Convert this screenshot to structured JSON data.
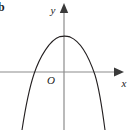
{
  "figure": {
    "background_color": "#ffffff",
    "corner_label": "b",
    "axis_color": "#8c8c8c",
    "curve_color": "#231f20",
    "label_color": "#1a1a1a"
  },
  "axes": {
    "x_axis": {
      "label": "x",
      "y_position": 72,
      "x_start": 0,
      "x_end": 118,
      "arrow_tip_x": 124,
      "label_x": 123,
      "label_y": 86
    },
    "y_axis": {
      "label": "y",
      "x_position": 64,
      "y_start": 130,
      "y_end": 10,
      "arrow_tip_y": 3,
      "label_x": 53,
      "label_y": 14
    },
    "origin": {
      "label": "O",
      "label_x": 51,
      "label_y": 84
    }
  },
  "chart_data": {
    "type": "line",
    "title": "",
    "subtitle": "",
    "xlabel": "x",
    "ylabel": "y",
    "grid": false,
    "legend": null,
    "annotations": [
      "O"
    ],
    "curve": {
      "name": "downward parabola",
      "shape": "parabola",
      "opens": "down",
      "vertex_px": [
        65,
        36
      ],
      "roots_px": [
        32,
        90
      ],
      "endpoints_px": [
        [
          22,
          130
        ],
        [
          103,
          130
        ]
      ],
      "path": "M 22,130 C 26,104 30,86 34,74 C 40,56 50,40 60,36.6 C 63,36 67,36 70,36.9 C 80,41 89,57 95,75 C 99,88 102,107 105,130",
      "stroke_width": 1.1
    },
    "xlim": [
      0,
      131
    ],
    "ylim": [
      130,
      0
    ]
  }
}
